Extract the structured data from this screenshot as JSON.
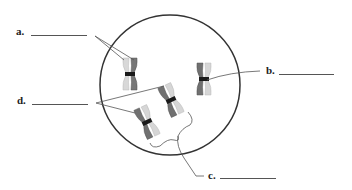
{
  "diagram": {
    "labels": {
      "a": "a.",
      "b": "b.",
      "c": "c.",
      "d": "d."
    },
    "colors": {
      "outline": "#333333",
      "leader": "#555555",
      "chromatid_dark": "#6e6e6e",
      "chromatid_light": "#d6d6d6",
      "centromere": "#1a1a1a"
    },
    "chromosomes": [
      {
        "id": "chromosome-a",
        "left_shade": "light",
        "right_shade": "dark"
      },
      {
        "id": "chromosome-b",
        "left_shade": "dark",
        "right_shade": "light"
      },
      {
        "id": "chromosome-d1",
        "left_shade": "dark",
        "right_shade": "light"
      },
      {
        "id": "chromosome-d2",
        "left_shade": "dark",
        "right_shade": "light"
      }
    ]
  }
}
